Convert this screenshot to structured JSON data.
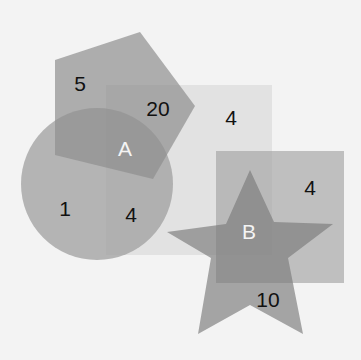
{
  "diagram": {
    "type": "overlapping-shapes",
    "colors": {
      "background": "#f3f3f3",
      "pentagon": "#a9a9a9",
      "circle": "#ababab",
      "big_rect": "#e4e4e4",
      "star": "#9c9c9c",
      "right_rect": "#b5b5b5",
      "text_dark": "#111111",
      "text_light": "#f4f4f4"
    },
    "labels": {
      "pentagon_only": "5",
      "pentagon_rect_overlap": "20",
      "big_rect_only": "4",
      "circle_only": "1",
      "circle_rect_overlap": "4",
      "region_a": "A",
      "right_rect_only": "4",
      "region_b": "B",
      "star_bottom": "10"
    }
  }
}
